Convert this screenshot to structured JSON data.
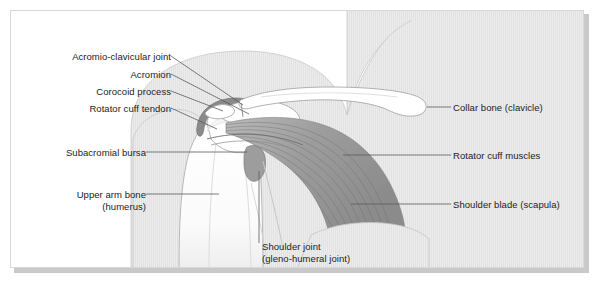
{
  "figure": {
    "background_color": "#ffffff",
    "border_color": "#d8d8d8",
    "shadow_color": "#c9c9c9",
    "text_color": "#222222",
    "leader_line_color": "#555555"
  },
  "palette": {
    "body_fill": "#e9e9e9",
    "body_stroke": "#c4c4c4",
    "bone_fill": "#ffffff",
    "bone_stroke": "#a8a8a8",
    "muscle_light": "#c0c0c0",
    "muscle_dark": "#8f8f8f",
    "bursa_fill": "#9a9a9a",
    "cartilage_fill": "#f2f2f2"
  },
  "labels": {
    "acromio_clavicular_joint": "Acromio-clavicular joint",
    "acromion": "Acromion",
    "corocoid_process": "Corocoid process",
    "rotator_cuff_tendon": "Rotator cuff tendon",
    "subacromial_bursa": "Subacromial bursa",
    "upper_arm_bone_line1": "Upper arm bone",
    "upper_arm_bone_line2": "(humerus)",
    "collar_bone": "Collar bone (clavicle)",
    "rotator_cuff_muscles": "Rotator cuff muscles",
    "shoulder_blade": "Shoulder blade (scapula)",
    "shoulder_joint_line1": "Shoulder joint",
    "shoulder_joint_line2": "(gleno-humeral joint)"
  }
}
